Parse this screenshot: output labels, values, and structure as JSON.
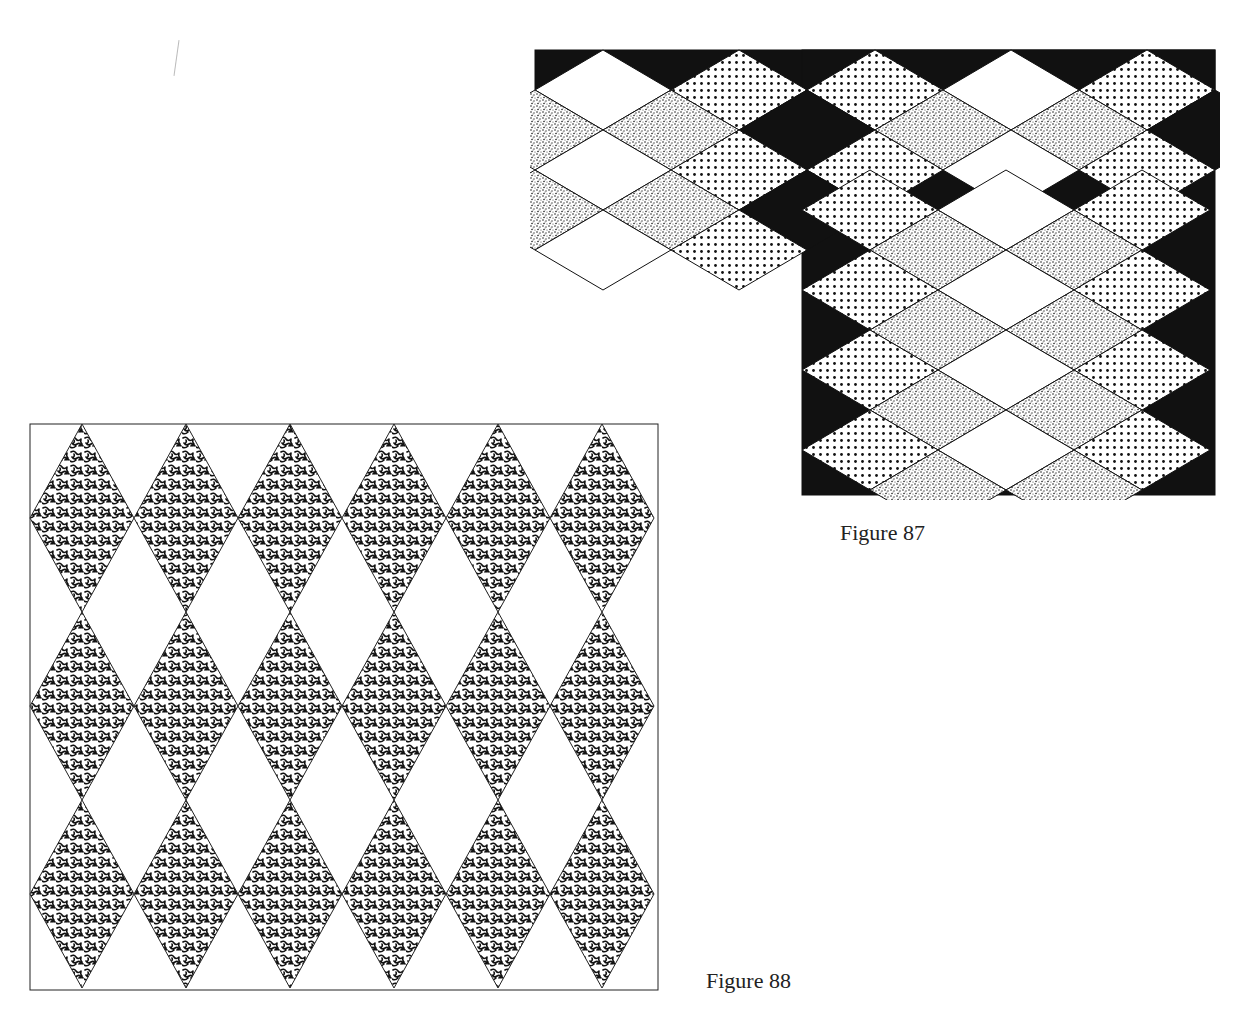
{
  "figures": [
    {
      "id": "figure-87",
      "caption": "Figure 87",
      "description": "Diamond (rhombus) tiling with four fills: white, coarse dot screen, fine stipple, and solid black; L-shaped layout with upper-left block and lower-right extension",
      "fills": [
        "white",
        "dots",
        "stipple",
        "black"
      ],
      "colors": {
        "ink": "#111111",
        "paper": "#ffffff"
      }
    },
    {
      "id": "figure-88",
      "caption": "Figure 88",
      "description": "Grid of 3 rows by 6 columns of tall vertical diamonds filled with a worm-like (labyrinth) texture, separated by white diamond spaces, inside a square frame",
      "rows": 3,
      "columns": 6,
      "fill": "labyrinth-texture",
      "colors": {
        "ink": "#111111",
        "paper": "#ffffff"
      }
    }
  ]
}
